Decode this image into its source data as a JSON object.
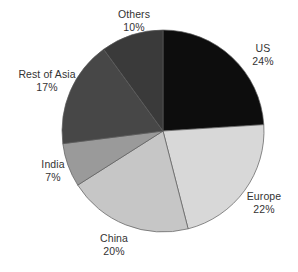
{
  "chart_data": {
    "type": "pie",
    "title": "",
    "subtitle": "",
    "xlabel": "",
    "ylabel": "",
    "legend_position": "none",
    "grid": false,
    "start_angle_deg": 0,
    "direction": "clockwise",
    "categories": [
      "US",
      "Europe",
      "China",
      "India",
      "Rest of Asia",
      "Others"
    ],
    "values": [
      24,
      22,
      20,
      7,
      17,
      10
    ],
    "value_unit": "%",
    "colors": [
      "#0d0d0d",
      "#d8d8d8",
      "#c6c6c6",
      "#9a9a9a",
      "#474747",
      "#3a3a3a"
    ],
    "slices": [
      {
        "label": "US",
        "value": 24,
        "value_text": "24%",
        "color": "#0d0d0d"
      },
      {
        "label": "Europe",
        "value": 22,
        "value_text": "22%",
        "color": "#d8d8d8"
      },
      {
        "label": "China",
        "value": 20,
        "value_text": "20%",
        "color": "#c6c6c6"
      },
      {
        "label": "India",
        "value": 7,
        "value_text": "7%",
        "color": "#9a9a9a"
      },
      {
        "label": "Rest of Asia",
        "value": 17,
        "value_text": "17%",
        "color": "#474747"
      },
      {
        "label": "Others",
        "value": 10,
        "value_text": "10%",
        "color": "#3a3a3a"
      }
    ]
  },
  "geometry": {
    "center_x": 163,
    "center_y": 131,
    "radius": 101
  }
}
